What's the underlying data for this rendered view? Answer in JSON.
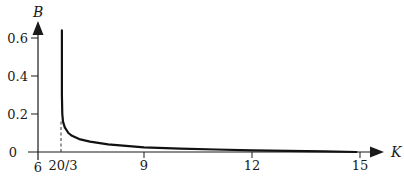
{
  "chart_data": {
    "type": "line",
    "title": "",
    "xlabel": "K",
    "ylabel": "B",
    "xlim": [
      6,
      15.6
    ],
    "ylim": [
      0,
      0.68
    ],
    "grid": false,
    "legend": null,
    "x_ticks": [
      {
        "value": 6,
        "label": "6"
      },
      {
        "value": 6.6667,
        "label": "20/3"
      },
      {
        "value": 9,
        "label": "9"
      },
      {
        "value": 12,
        "label": "12"
      },
      {
        "value": 15,
        "label": "15"
      }
    ],
    "y_ticks": [
      {
        "value": 0,
        "label": "0"
      },
      {
        "value": 0.2,
        "label": "0.2"
      },
      {
        "value": 0.4,
        "label": "0.4"
      },
      {
        "value": 0.6,
        "label": "0.6"
      }
    ],
    "annotations": [
      {
        "type": "dashed-vertical-line",
        "x": 6.6667,
        "y_from": 0,
        "y_to": 0.16,
        "note": "asymptote at K = 20/3"
      }
    ],
    "series": [
      {
        "name": "B(K)",
        "x": [
          6.72,
          6.72,
          6.73,
          6.75,
          6.8,
          6.9,
          7.0,
          7.2,
          7.5,
          8.0,
          9.0,
          10.0,
          11.0,
          12.0,
          13.0,
          14.0,
          14.9
        ],
        "y": [
          0.64,
          0.3,
          0.2,
          0.16,
          0.13,
          0.1,
          0.085,
          0.068,
          0.055,
          0.04,
          0.025,
          0.018,
          0.013,
          0.009,
          0.006,
          0.003,
          0.0
        ]
      }
    ],
    "colors": {
      "curve": "#111111",
      "axes": "#1a1a1a",
      "dashed": "#333333"
    }
  }
}
